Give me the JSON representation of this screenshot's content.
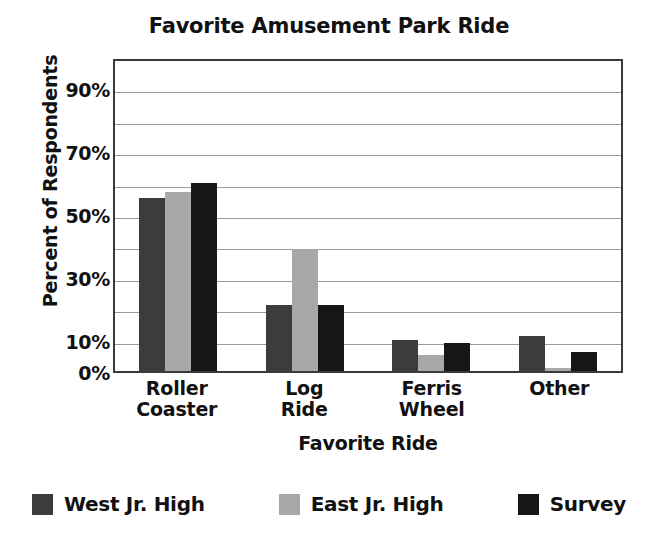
{
  "chart_data": {
    "type": "bar",
    "title": "Favorite Amusement Park Ride",
    "xlabel": "Favorite Ride",
    "ylabel": "Percent of Respondents",
    "categories": [
      "Roller Coaster",
      "Log Ride",
      "Ferris Wheel",
      "Other"
    ],
    "category_lines": [
      [
        "Roller",
        "Coaster"
      ],
      [
        "Log",
        "Ride"
      ],
      [
        "Ferris",
        "Wheel"
      ],
      [
        "Other"
      ]
    ],
    "series": [
      {
        "name": "West Jr. High",
        "color": "#3c3c3c",
        "values": [
          55,
          21,
          10,
          11
        ]
      },
      {
        "name": "East Jr. High",
        "color": "#a8a8a8",
        "values": [
          57,
          39,
          5,
          1
        ]
      },
      {
        "name": "Survey",
        "color": "#161616",
        "values": [
          60,
          21,
          9,
          6
        ]
      }
    ],
    "ylim": [
      0,
      100
    ],
    "ytick_values": [
      0,
      10,
      30,
      50,
      70,
      90
    ],
    "ytick_labels": [
      "0%",
      "10%",
      "30%",
      "50%",
      "70%",
      "90%"
    ],
    "gridline_values": [
      10,
      20,
      30,
      40,
      50,
      60,
      70,
      80,
      90
    ],
    "grid": true,
    "grid_color": "#9a9a9a",
    "axis_color": "#3a3a3a",
    "legend_position": "bottom",
    "background": "#ffffff"
  }
}
